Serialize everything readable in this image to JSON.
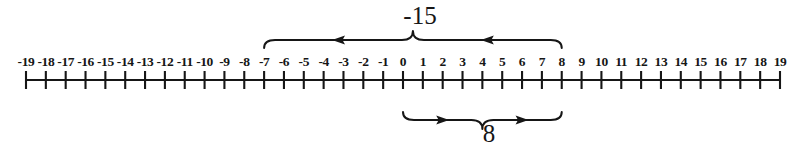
{
  "figure": {
    "kind": "number-line-diagram",
    "background_color": "#ffffff",
    "ink_color": "#161616"
  },
  "number_line": {
    "min": -19,
    "max": 19,
    "step": 1,
    "axis_y": 80,
    "pixel_left": 26,
    "pixel_right": 780,
    "tick_height_up": 9,
    "tick_height_down": 9,
    "labels": [
      "-19",
      "-18",
      "-17",
      "-16",
      "-15",
      "-14",
      "-13",
      "-12",
      "-11",
      "-10",
      "-9",
      "-8",
      "-7",
      "-6",
      "-5",
      "-4",
      "-3",
      "-2",
      "-1",
      "0",
      "1",
      "2",
      "3",
      "4",
      "5",
      "6",
      "7",
      "8",
      "9",
      "10",
      "11",
      "12",
      "13",
      "14",
      "15",
      "16",
      "17",
      "18",
      "19"
    ],
    "values": [
      -19,
      -18,
      -17,
      -16,
      -15,
      -14,
      -13,
      -12,
      -11,
      -10,
      -9,
      -8,
      -7,
      -6,
      -5,
      -4,
      -3,
      -2,
      -1,
      0,
      1,
      2,
      3,
      4,
      5,
      6,
      7,
      8,
      9,
      10,
      11,
      12,
      13,
      14,
      15,
      16,
      17,
      18,
      19
    ]
  },
  "braces": [
    {
      "id": "top-brace",
      "label": "-15",
      "position": "above",
      "from_value": 8,
      "to_value": -7,
      "span_left_value": -7,
      "span_right_value": 8,
      "magnitude": 15,
      "direction": "left",
      "arrow_count": 2,
      "label_x": 420,
      "label_y": 24
    },
    {
      "id": "bottom-brace",
      "label": "8",
      "position": "below",
      "from_value": 0,
      "to_value": 8,
      "span_left_value": 0,
      "span_right_value": 8,
      "magnitude": 8,
      "direction": "right",
      "arrow_count": 2,
      "label_x": 489,
      "label_y": 142
    }
  ]
}
